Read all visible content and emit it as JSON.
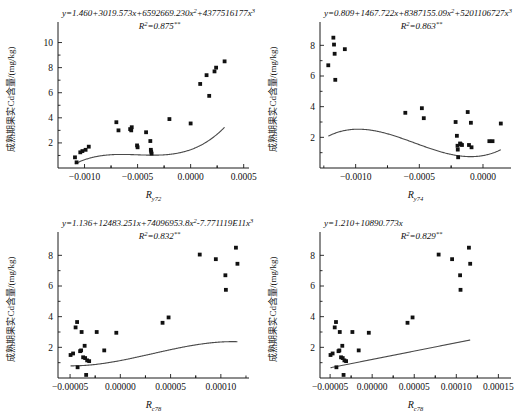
{
  "figure": {
    "panels": [
      {
        "id": "panel-a",
        "equation_prefix": "y=1.460+3019.573x+6592669.230x",
        "equation_mid": "+4377516177x",
        "exp1": "2",
        "exp2": "3",
        "r2_label": "R",
        "r2_sup": "2",
        "r2_value": "=0.875",
        "r2_stars": "**",
        "ylabel": "成熟期果实Cd含量/(mg/kg)",
        "xlabel_base": "R",
        "xlabel_sub": "y72",
        "yticks": [
          "2",
          "4",
          "6",
          "8",
          "10"
        ],
        "xticks": [
          "-0.0010",
          "-0.0005",
          "0.0000",
          "0.0005"
        ]
      },
      {
        "id": "panel-b",
        "equation_prefix": "y=0.809+1467.722x+8387155.09x",
        "equation_mid": "+5201106727x",
        "exp1": "2",
        "exp2": "3",
        "r2_label": "R",
        "r2_sup": "2",
        "r2_value": "=0.863",
        "r2_stars": "**",
        "ylabel": "成熟期果实Cd含量/(mg/kg)",
        "xlabel_base": "R",
        "xlabel_sub": "y74",
        "yticks": [
          "2",
          "4",
          "6",
          "8"
        ],
        "xticks": [
          "-0.0010",
          "-0.0005",
          "0.0000"
        ]
      },
      {
        "id": "panel-c",
        "equation_prefix": "y=1.136+12483.251x+74096953.8x",
        "equation_mid": "-7.771119E11x",
        "exp1": "2",
        "exp2": "3",
        "r2_label": "R",
        "r2_sup": "2",
        "r2_value": "=0.832",
        "r2_stars": "**",
        "ylabel": "成熟期果实Cd含量/(mg/kg)",
        "xlabel_base": "R",
        "xlabel_sub": "c78",
        "yticks": [
          "2",
          "4",
          "6",
          "8"
        ],
        "xticks": [
          "-0.00005",
          "0.00000",
          "0.00005",
          "0.00010"
        ]
      },
      {
        "id": "panel-d",
        "equation_prefix": "y=1.210+10890.773x",
        "equation_mid": "",
        "exp1": "",
        "exp2": "",
        "r2_label": "R",
        "r2_sup": "2",
        "r2_value": "=0.829",
        "r2_stars": "**",
        "ylabel": "成熟期果实Cd含量/(mg/kg)",
        "xlabel_base": "R",
        "xlabel_sub": "c78",
        "yticks": [
          "2",
          "4",
          "6",
          "8"
        ],
        "xticks": [
          "-0.00005",
          "0.00000",
          "0.00005",
          "0.00010",
          "0.00015"
        ]
      }
    ]
  },
  "chart_data": [
    {
      "type": "scatter",
      "title": "",
      "xlabel": "R_y72",
      "ylabel": "成熟期果实Cd含量/(mg/kg)",
      "xlim": [
        -0.00125,
        0.00055
      ],
      "ylim": [
        0,
        11
      ],
      "xticks": [
        -0.001,
        -0.0005,
        0.0,
        0.0005
      ],
      "yticks": [
        2,
        4,
        6,
        8,
        10
      ],
      "grid": false,
      "fit": {
        "kind": "cubic",
        "equation": "y=1.460+3019.573x+6592669.230x^2+4377516177x^3",
        "r2": 0.875,
        "significance": "**",
        "coefficients": [
          1.46,
          3019.573,
          6592669.23,
          4377516177
        ]
      },
      "points": [
        {
          "x": -0.00109,
          "y": 0.85
        },
        {
          "x": -0.001075,
          "y": 0.45
        },
        {
          "x": -0.00104,
          "y": 1.25
        },
        {
          "x": -0.00102,
          "y": 1.35
        },
        {
          "x": -0.00099,
          "y": 1.45
        },
        {
          "x": -0.00096,
          "y": 1.7
        },
        {
          "x": -0.0007,
          "y": 3.65
        },
        {
          "x": -0.00068,
          "y": 3.0
        },
        {
          "x": -0.00057,
          "y": 3.1
        },
        {
          "x": -0.00056,
          "y": 3.0
        },
        {
          "x": -0.000555,
          "y": 3.25
        },
        {
          "x": -0.000505,
          "y": 1.8
        },
        {
          "x": -0.0005,
          "y": 1.65
        },
        {
          "x": -0.00042,
          "y": 2.85
        },
        {
          "x": -0.00038,
          "y": 2.15
        },
        {
          "x": -0.000375,
          "y": 1.45
        },
        {
          "x": -0.000372,
          "y": 1.3
        },
        {
          "x": -0.000368,
          "y": 1.15
        },
        {
          "x": -0.0002,
          "y": 3.9
        },
        {
          "x": 0.0,
          "y": 3.55
        },
        {
          "x": 9e-05,
          "y": 6.7
        },
        {
          "x": 0.00015,
          "y": 7.4
        },
        {
          "x": 0.000175,
          "y": 5.75
        },
        {
          "x": 0.000225,
          "y": 7.7
        },
        {
          "x": 0.00024,
          "y": 8.0
        },
        {
          "x": 0.00032,
          "y": 8.5
        }
      ]
    },
    {
      "type": "scatter",
      "title": "",
      "xlabel": "R_y74",
      "ylabel": "成熟期果实Cd含量/(mg/kg)",
      "xlim": [
        -0.00128,
        0.00022
      ],
      "ylim": [
        0,
        9
      ],
      "xticks": [
        -0.001,
        -0.0005,
        0.0
      ],
      "yticks": [
        2,
        4,
        6,
        8
      ],
      "grid": false,
      "fit": {
        "kind": "cubic",
        "equation": "y=0.809+1467.722x+8387155.09x^2+5201106727x^3",
        "r2": 0.863,
        "significance": "**",
        "coefficients": [
          0.809,
          1467.722,
          8387155.09,
          5201106727
        ]
      },
      "points": [
        {
          "x": -0.001215,
          "y": 6.7
        },
        {
          "x": -0.001175,
          "y": 8.5
        },
        {
          "x": -0.00117,
          "y": 8.05
        },
        {
          "x": -0.001165,
          "y": 7.45
        },
        {
          "x": -0.00116,
          "y": 5.75
        },
        {
          "x": -0.001085,
          "y": 7.75
        },
        {
          "x": -0.00061,
          "y": 3.6
        },
        {
          "x": -0.00048,
          "y": 3.9
        },
        {
          "x": -0.000465,
          "y": 3.25
        },
        {
          "x": -0.000215,
          "y": 3.0
        },
        {
          "x": -0.000205,
          "y": 2.1
        },
        {
          "x": -0.0002,
          "y": 1.45
        },
        {
          "x": -0.000198,
          "y": 1.2
        },
        {
          "x": -0.000195,
          "y": 0.7
        },
        {
          "x": -0.00018,
          "y": 1.6
        },
        {
          "x": -0.000175,
          "y": 1.55
        },
        {
          "x": -0.000165,
          "y": 1.5
        },
        {
          "x": -0.00012,
          "y": 3.65
        },
        {
          "x": -0.00011,
          "y": 1.5
        },
        {
          "x": -9.5e-05,
          "y": 2.95
        },
        {
          "x": -9e-05,
          "y": 1.35
        },
        {
          "x": 5e-05,
          "y": 1.75
        },
        {
          "x": 7.5e-05,
          "y": 1.75
        },
        {
          "x": 0.00014,
          "y": 2.9
        }
      ]
    },
    {
      "type": "scatter",
      "title": "",
      "xlabel": "R_c78",
      "ylabel": "成熟期果实Cd含量/(mg/kg)",
      "xlim": [
        -6.2e-05,
        0.000128
      ],
      "ylim": [
        0,
        9
      ],
      "xticks": [
        -5e-05,
        0.0,
        5e-05,
        0.0001
      ],
      "yticks": [
        2,
        4,
        6,
        8
      ],
      "grid": false,
      "fit": {
        "kind": "cubic",
        "equation": "y=1.136+12483.251x+74096953.8x^2-7.771119E11x^3",
        "r2": 0.832,
        "significance": "**",
        "coefficients": [
          1.136,
          12483.251,
          74096953.8,
          -777111900000
        ]
      },
      "points": [
        {
          "x": -4.95e-05,
          "y": 1.5
        },
        {
          "x": -4.7e-05,
          "y": 1.6
        },
        {
          "x": -4.45e-05,
          "y": 3.3
        },
        {
          "x": -4.3e-05,
          "y": 3.65
        },
        {
          "x": -4.25e-05,
          "y": 0.7
        },
        {
          "x": -4e-05,
          "y": 1.75
        },
        {
          "x": -3.9e-05,
          "y": 1.8
        },
        {
          "x": -3.85e-05,
          "y": 3.0
        },
        {
          "x": -3.7e-05,
          "y": 1.35
        },
        {
          "x": -3.55e-05,
          "y": 2.1
        },
        {
          "x": -3.5e-05,
          "y": 1.3
        },
        {
          "x": -3.4e-05,
          "y": 0.2
        },
        {
          "x": -3.3e-05,
          "y": 1.15
        },
        {
          "x": -3.1e-05,
          "y": 1.1
        },
        {
          "x": -2.35e-05,
          "y": 3.0
        },
        {
          "x": -1.6e-05,
          "y": 1.8
        },
        {
          "x": -4e-06,
          "y": 2.95
        },
        {
          "x": 4.2e-05,
          "y": 3.6
        },
        {
          "x": 4.8e-05,
          "y": 3.95
        },
        {
          "x": 7.9e-05,
          "y": 8.05
        },
        {
          "x": 9.5e-05,
          "y": 7.75
        },
        {
          "x": 0.0001045,
          "y": 6.7
        },
        {
          "x": 0.000105,
          "y": 5.75
        },
        {
          "x": 0.000115,
          "y": 8.5
        },
        {
          "x": 0.0001165,
          "y": 7.45
        }
      ]
    },
    {
      "type": "scatter",
      "title": "",
      "xlabel": "R_c78",
      "ylabel": "成熟期果实Cd含量/(mg/kg)",
      "xlim": [
        -6.2e-05,
        0.000165
      ],
      "ylim": [
        0,
        9
      ],
      "xticks": [
        -5e-05,
        0.0,
        5e-05,
        0.0001,
        0.00015
      ],
      "yticks": [
        2,
        4,
        6,
        8
      ],
      "grid": false,
      "fit": {
        "kind": "linear",
        "equation": "y=1.210+10890.773x",
        "r2": 0.829,
        "significance": "**",
        "coefficients": [
          1.21,
          10890.773
        ]
      },
      "points": [
        {
          "x": -4.95e-05,
          "y": 1.5
        },
        {
          "x": -4.7e-05,
          "y": 1.6
        },
        {
          "x": -4.45e-05,
          "y": 3.3
        },
        {
          "x": -4.3e-05,
          "y": 3.65
        },
        {
          "x": -4.25e-05,
          "y": 0.7
        },
        {
          "x": -4e-05,
          "y": 1.75
        },
        {
          "x": -3.9e-05,
          "y": 1.8
        },
        {
          "x": -3.85e-05,
          "y": 3.0
        },
        {
          "x": -3.7e-05,
          "y": 1.35
        },
        {
          "x": -3.55e-05,
          "y": 2.1
        },
        {
          "x": -3.5e-05,
          "y": 1.3
        },
        {
          "x": -3.4e-05,
          "y": 0.2
        },
        {
          "x": -3.3e-05,
          "y": 1.15
        },
        {
          "x": -3.1e-05,
          "y": 1.1
        },
        {
          "x": -2.35e-05,
          "y": 3.0
        },
        {
          "x": -1.6e-05,
          "y": 1.8
        },
        {
          "x": -4e-06,
          "y": 2.95
        },
        {
          "x": 4.2e-05,
          "y": 3.6
        },
        {
          "x": 4.8e-05,
          "y": 3.95
        },
        {
          "x": 7.9e-05,
          "y": 8.05
        },
        {
          "x": 9.5e-05,
          "y": 7.75
        },
        {
          "x": 0.0001045,
          "y": 6.7
        },
        {
          "x": 0.000105,
          "y": 5.75
        },
        {
          "x": 0.000115,
          "y": 8.5
        },
        {
          "x": 0.0001165,
          "y": 7.45
        }
      ]
    }
  ]
}
